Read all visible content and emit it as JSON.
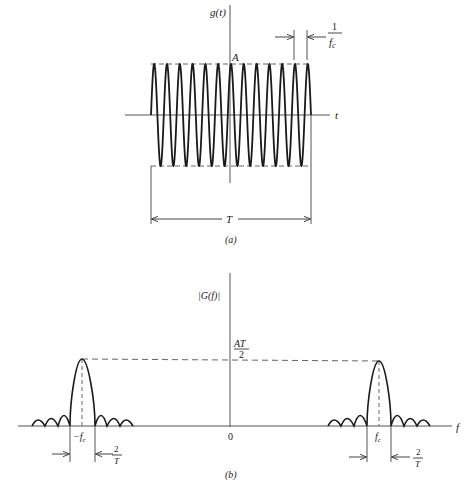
{
  "figure_a": {
    "caption": "(a)",
    "y_axis_label": "g(t)",
    "x_axis_label": "t",
    "amplitude_label": "A",
    "period_label_num": "1",
    "period_label_den": "f",
    "period_label_sub": "c",
    "duration_label": "T",
    "num_peaks": 13
  },
  "figure_b": {
    "caption": "(b)",
    "y_axis_label": "|G(f)|",
    "x_axis_label": "f",
    "origin_label": "0",
    "peak_label_num": "AT",
    "peak_label_den": "2",
    "neg_fc_label": "−f",
    "pos_fc_label": "f",
    "fc_sub": "c",
    "bandwidth_label_num": "2",
    "bandwidth_label_den": "T"
  },
  "colors": {
    "ink": "#1a1a1a",
    "axis": "#555555",
    "dash": "#666666",
    "background": "#ffffff"
  }
}
